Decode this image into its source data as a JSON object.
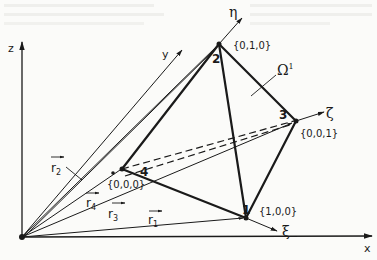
{
  "diagram": {
    "axes": {
      "x": "x",
      "y": "y",
      "z": "z"
    },
    "local_axes": {
      "xi": "ξ",
      "eta": "η",
      "zeta": "ζ"
    },
    "region_label": "Ω",
    "region_superscript": "1",
    "nodes": [
      {
        "number": "1",
        "coords": "{1,0,0}"
      },
      {
        "number": "2",
        "coords": "{0,1,0}"
      },
      {
        "number": "3",
        "coords": "{0,0,1}"
      },
      {
        "number": "4",
        "coords": "{0,0,0}"
      }
    ],
    "position_vectors": [
      {
        "name": "r",
        "subscript": "1"
      },
      {
        "name": "r",
        "subscript": "2"
      },
      {
        "name": "r",
        "subscript": "3"
      },
      {
        "name": "r",
        "subscript": "4"
      }
    ],
    "colors": {
      "ink": "#1a1a1a",
      "paper": "#fbfbf9"
    }
  }
}
